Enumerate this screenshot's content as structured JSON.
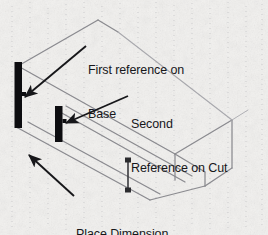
{
  "figure": {
    "type": "isometric-technical-illustration",
    "background_color": "#f2f1ef",
    "ink_color": "#17171a",
    "wireframe_color": "#8b8b90",
    "annotations": [
      {
        "id": "first-reference",
        "line1": "First reference on",
        "line2": "Base",
        "leader": "arrow pointing down-left to first reference bar"
      },
      {
        "id": "second-reference",
        "line1": "Second",
        "line2": "Reference on Cut",
        "leader": "arrow pointing down-left to second reference bar"
      },
      {
        "id": "place-dimension",
        "line1": "Place Dimension",
        "line2": "",
        "leader": "arrow pointing up-left toward dimension location"
      }
    ],
    "markers": {
      "first_reference_bar": "thick vertical black bar on left face",
      "second_reference_bar": "short thick vertical black bar on cut face",
      "dimension_line": "short vertical dimension line with square endpoints"
    }
  }
}
